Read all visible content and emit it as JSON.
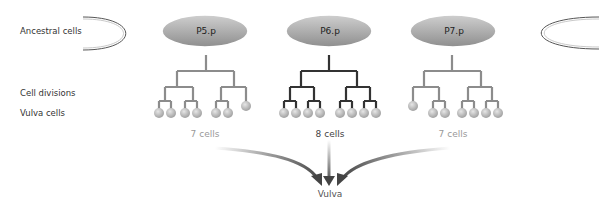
{
  "row_labels": {
    "ancestral": "Ancestral cells",
    "divisions": "Cell divisions",
    "vulva_cells": "Vulva cells"
  },
  "precursors": [
    {
      "name": "P5.p",
      "cell_count_label": "7 cells",
      "cell_count": 7,
      "lineage_color": "#8c8c8c",
      "count_color": "#999999"
    },
    {
      "name": "P6.p",
      "cell_count_label": "8 cells",
      "cell_count": 8,
      "lineage_color": "#333333",
      "count_color": "#444444"
    },
    {
      "name": "P7.p",
      "cell_count_label": "7 cells",
      "cell_count": 7,
      "lineage_color": "#8c8c8c",
      "count_color": "#999999"
    }
  ],
  "target": {
    "label": "Vulva"
  },
  "colors": {
    "ellipse_fill_light": "#d8d8d8",
    "ellipse_fill_dark": "#9a9a9a",
    "cell_fill": "#b5b5b5",
    "arrow_dark": "#4a4a4a"
  }
}
